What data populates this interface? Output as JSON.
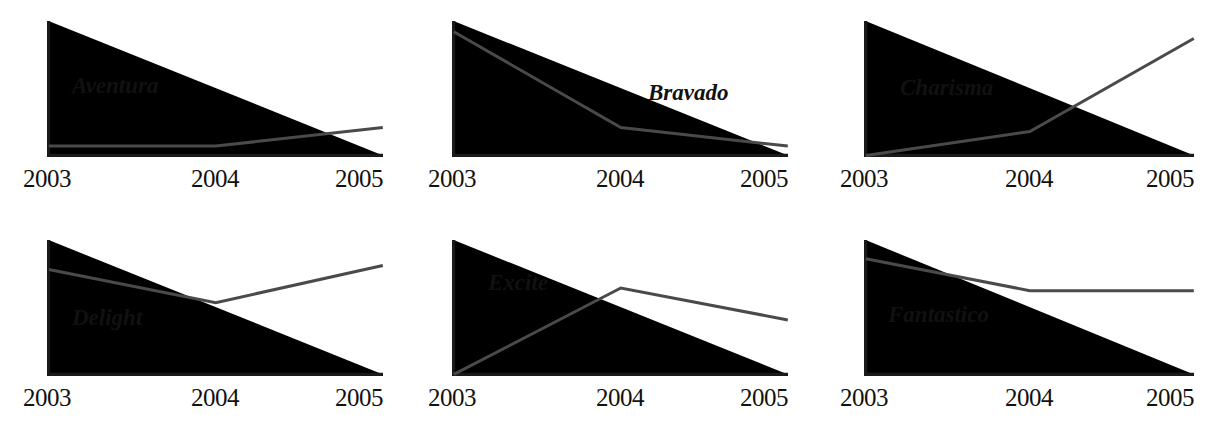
{
  "chart_data": {
    "type": "line",
    "title": "",
    "subtitle": "",
    "xlabel": "",
    "ylabel": "",
    "grid": false,
    "legend_position": "inline-label",
    "axis_color": "#1a1a1a",
    "line_color": "#4a4a4a",
    "background_color": "#ffffff",
    "layout": {
      "rows": 2,
      "columns": 3,
      "small_multiples": true
    },
    "categories": [
      "2003",
      "2004",
      "2005"
    ],
    "tick_labels": [
      "2003",
      "2004",
      "2005"
    ],
    "ylim": [
      0,
      1
    ],
    "y_axis_ticks_shown": false,
    "series": [
      {
        "name": "Aventura",
        "values": [
          0.07,
          0.07,
          0.21
        ]
      },
      {
        "name": "Bravado",
        "values": [
          0.93,
          0.21,
          0.07
        ]
      },
      {
        "name": "Charisma",
        "values": [
          0.0,
          0.18,
          0.88
        ]
      },
      {
        "name": "Delight",
        "values": [
          0.79,
          0.54,
          0.82
        ]
      },
      {
        "name": "Excite",
        "values": [
          0.0,
          0.65,
          0.41
        ]
      },
      {
        "name": "Fantastico",
        "values": [
          0.87,
          0.63,
          0.63
        ]
      }
    ]
  },
  "panels": [
    {
      "id": "aventura",
      "label": "Aventura",
      "ticks": {
        "start": "2003",
        "middle": "2004",
        "end": "2005"
      }
    },
    {
      "id": "bravado",
      "label": "Bravado",
      "ticks": {
        "start": "2003",
        "middle": "2004",
        "end": "2005"
      }
    },
    {
      "id": "charisma",
      "label": "Charisma",
      "ticks": {
        "start": "2003",
        "middle": "2004",
        "end": "2005"
      }
    },
    {
      "id": "delight",
      "label": "Delight",
      "ticks": {
        "start": "2003",
        "middle": "2004",
        "end": "2005"
      }
    },
    {
      "id": "excite",
      "label": "Excite",
      "ticks": {
        "start": "2003",
        "middle": "2004",
        "end": "2005"
      }
    },
    {
      "id": "fantastico",
      "label": "Fantastico",
      "ticks": {
        "start": "2003",
        "middle": "2004",
        "end": "2005"
      }
    }
  ]
}
